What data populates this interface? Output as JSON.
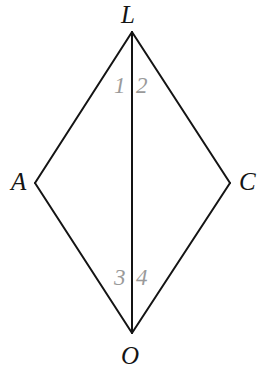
{
  "figure": {
    "type": "geometry-diagram",
    "shape_name": "kite LACO with vertical diagonal LO",
    "background_color": "#ffffff",
    "stroke_color": "#141414",
    "stroke_width": 2,
    "vertex_label_color": "#141414",
    "angle_label_color": "#9a9a9a",
    "vertices": [
      {
        "id": "L",
        "label": "L",
        "x": 132,
        "y": 32
      },
      {
        "id": "A",
        "label": "A",
        "x": 35,
        "y": 183
      },
      {
        "id": "C",
        "label": "C",
        "x": 230,
        "y": 183
      },
      {
        "id": "O",
        "label": "O",
        "x": 132,
        "y": 333
      }
    ],
    "edges": [
      {
        "id": "LA",
        "from": "L",
        "to": "A"
      },
      {
        "id": "LC",
        "from": "L",
        "to": "C"
      },
      {
        "id": "AO",
        "from": "A",
        "to": "O"
      },
      {
        "id": "CO",
        "from": "C",
        "to": "O"
      },
      {
        "id": "LO",
        "from": "L",
        "to": "O",
        "role": "diagonal"
      }
    ],
    "angle_labels": [
      {
        "id": "1",
        "label": "1",
        "at_vertex": "L",
        "side": "left"
      },
      {
        "id": "2",
        "label": "2",
        "at_vertex": "L",
        "side": "right"
      },
      {
        "id": "3",
        "label": "3",
        "at_vertex": "O",
        "side": "left"
      },
      {
        "id": "4",
        "label": "4",
        "at_vertex": "O",
        "side": "right"
      }
    ]
  }
}
